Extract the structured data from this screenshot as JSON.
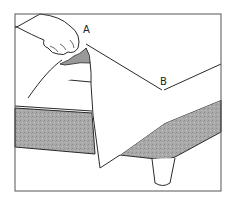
{
  "illustration": {
    "subject": "hand lifting sheet corner off a bed mattress",
    "labels": [
      {
        "id": "A",
        "text": "A"
      },
      {
        "id": "B",
        "text": "B"
      }
    ],
    "colors": {
      "line": "#2a2a2a",
      "mattress_fill": "#a9a9a9",
      "sheet_fill": "#ffffff",
      "frame": "#555555",
      "background": "#ffffff"
    }
  }
}
